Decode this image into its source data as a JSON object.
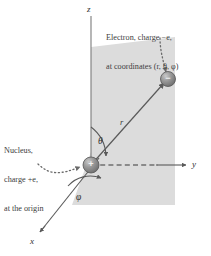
{
  "figure": {
    "background_color": "#ffffff",
    "plane_fill": "#dcdcdc",
    "line_color": "#5a5a5a",
    "text_color": "#3a3a3a",
    "sphere_color": "#8c8c8c"
  },
  "callouts": {
    "electron": {
      "line1": "Electron, charge −e,",
      "line2": "at coordinates (r, θ, φ)"
    },
    "nucleus": {
      "line1": "Nucleus,",
      "line2": "charge +e,",
      "line3": "at the origin"
    }
  },
  "axes": [
    {
      "name": "z-axis",
      "label": "z"
    },
    {
      "name": "y-axis",
      "label": "y"
    },
    {
      "name": "x-axis",
      "label": "x"
    }
  ],
  "symbols": {
    "radius": "r",
    "theta": "θ",
    "phi": "φ"
  },
  "particles": {
    "nucleus": {
      "sign": "+",
      "charge": "+e"
    },
    "electron": {
      "sign": "−",
      "charge": "−e"
    }
  }
}
